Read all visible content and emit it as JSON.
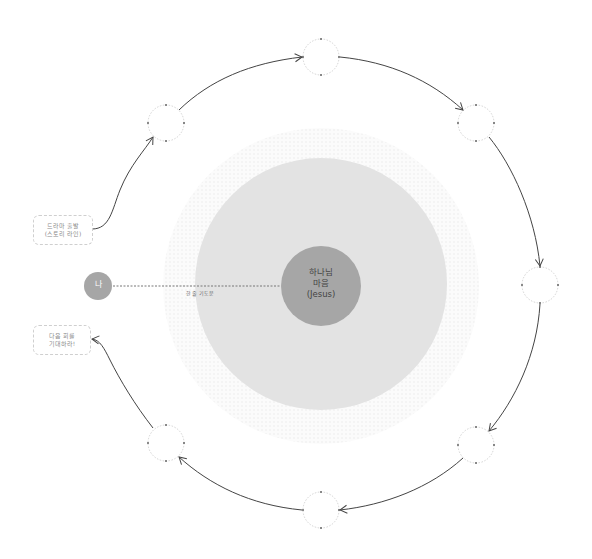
{
  "diagram": {
    "center": {
      "line1": "하나님",
      "line2": "마음",
      "line3": "(Jesus)"
    },
    "me": {
      "label": "나"
    },
    "connector_label": "한 줄 기도문",
    "start_box": {
      "line1": "드라마 출발",
      "line2": "(스토리 라인)"
    },
    "end_box": {
      "line1": "다음 회를",
      "line2": "기대하라!"
    },
    "orbit_nodes": [
      {
        "position": "top-left"
      },
      {
        "position": "top"
      },
      {
        "position": "top-right"
      },
      {
        "position": "right"
      },
      {
        "position": "bottom-right"
      },
      {
        "position": "bottom"
      },
      {
        "position": "bottom-left"
      }
    ],
    "colors": {
      "center_circle": "#a6a6a6",
      "middle_circle": "#e3e3e3",
      "halo": "#f2f2f2",
      "me_circle": "#a6a6a6",
      "arrow": "#444444",
      "node_outline": "#c8c8c8"
    }
  }
}
